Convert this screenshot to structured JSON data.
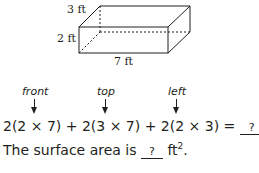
{
  "figure": {
    "dim_height_top": "3 ft",
    "dim_left": "2 ft",
    "dim_bottom": "7 ft"
  },
  "labels": {
    "front": "front",
    "top": "top",
    "left": "left"
  },
  "equation": {
    "expression": "2(2 × 7) + 2(3 × 7) + 2(2 × 3) = ",
    "blank": "?"
  },
  "sentence": {
    "prefix": "The surface area is ",
    "blank": "?",
    "unit": " ft",
    "exponent": "2",
    "suffix": "."
  }
}
